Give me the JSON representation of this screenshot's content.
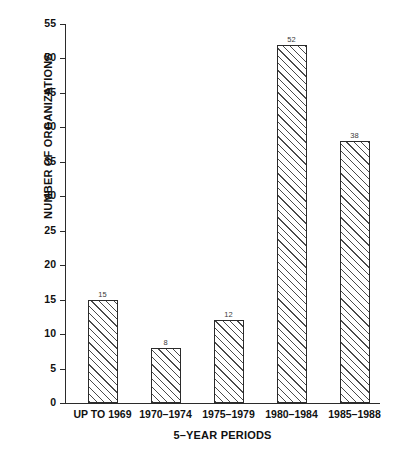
{
  "chart_data": {
    "type": "bar",
    "title": "",
    "xlabel": "5–YEAR PERIODS",
    "ylabel": "NUMBER OF ORGANIZATIONS",
    "categories": [
      "UP TO 1969",
      "1970–1974",
      "1975–1979",
      "1980–1984",
      "1985–1988"
    ],
    "values": [
      15,
      8,
      12,
      52,
      38
    ],
    "value_labels": [
      "15",
      "8",
      "12",
      "52",
      "38"
    ],
    "ylim": [
      0,
      55
    ],
    "ytick_step": 5,
    "ytick_labels": [
      "0",
      "5",
      "10",
      "15",
      "20",
      "25",
      "30",
      "35",
      "40",
      "45",
      "50",
      "55"
    ],
    "grid": false,
    "legend": null,
    "bar_fill": "hatched-diagonal",
    "bar_edge_color": "#2b2b2b",
    "background_color": "#ffffff"
  }
}
